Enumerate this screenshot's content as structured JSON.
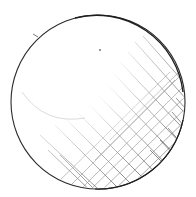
{
  "image": {
    "subject": "pencil sketch of a sphere with cross-hatched shading",
    "background_color": "#ffffff",
    "stroke_color": "#2a2a2a",
    "hatch_color": "#555555",
    "sphere": {
      "cx": 98,
      "cy": 102,
      "r": 87
    }
  }
}
